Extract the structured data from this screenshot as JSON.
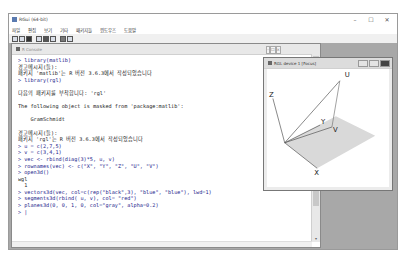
{
  "window": {
    "title": "RGui (64-bit)",
    "controls": {
      "minimize": "–",
      "maximize": "☐",
      "close": "✕"
    }
  },
  "menubar": {
    "items": [
      {
        "label": "파일"
      },
      {
        "label": "편집"
      },
      {
        "label": "보기"
      },
      {
        "label": "기타"
      },
      {
        "label": "패키지들"
      },
      {
        "label": "윈도우즈"
      },
      {
        "label": "도움말"
      }
    ]
  },
  "toolbar": {
    "buttons": [
      {
        "icon": "open-script-icon"
      },
      {
        "icon": "load-workspace-icon"
      },
      {
        "icon": "save-workspace-icon"
      },
      {
        "icon": "copy-icon"
      },
      {
        "icon": "paste-icon"
      },
      {
        "icon": "copy-paste-icon"
      },
      {
        "icon": "stop-icon"
      },
      {
        "icon": "print-icon"
      }
    ]
  },
  "console": {
    "title": "R Console",
    "lines": [
      {
        "type": "in",
        "text": "> library(matlib)"
      },
      {
        "type": "out",
        "text": "경고메시지(들):"
      },
      {
        "type": "out",
        "text": "패키지 'matlib'는 R 버전 3.6.3에서 작성되었습니다"
      },
      {
        "type": "in",
        "text": "> library(rgl)"
      },
      {
        "type": "out",
        "text": ""
      },
      {
        "type": "out",
        "text": "다음의 패키지를 부착합니다: 'rgl'"
      },
      {
        "type": "out",
        "text": ""
      },
      {
        "type": "out",
        "text": "The following object is masked from 'package:matlib':"
      },
      {
        "type": "out",
        "text": ""
      },
      {
        "type": "out",
        "text": "    GramSchmidt"
      },
      {
        "type": "out",
        "text": ""
      },
      {
        "type": "out",
        "text": "경고메시지(들):"
      },
      {
        "type": "out",
        "text": "패키지 'rgl'는 R 버전 3.6.3에서 작성되었습니다"
      },
      {
        "type": "in",
        "text": "> u = c(2,7,5)"
      },
      {
        "type": "in",
        "text": "> v = c(3,4,1)"
      },
      {
        "type": "in",
        "text": "> vec <- rbind(diag(3)*5, u, v)"
      },
      {
        "type": "in",
        "text": "> rownames(vec) <- c(\"X\", \"Y\", \"Z\", \"U\", \"V\")"
      },
      {
        "type": "in",
        "text": "> open3d()"
      },
      {
        "type": "out",
        "text": "wgl"
      },
      {
        "type": "out",
        "text": "  1"
      },
      {
        "type": "in",
        "text": "> vectors3d(vec, col=c(rep(\"black\",3), \"blue\", \"blue\"), lwd=1)"
      },
      {
        "type": "in",
        "text": "> segments3d(rbind( u, v), col= \"red\")"
      },
      {
        "type": "in",
        "text": "> planes3d(0, 0, 1, 0, col=\"gray\", alpha=0.2)"
      },
      {
        "type": "in",
        "text": "> |"
      }
    ]
  },
  "rgl_device": {
    "title": "RGL device 1 [Focus]",
    "labels": {
      "x": "X",
      "y": "Y",
      "z": "Z",
      "u": "U",
      "v": "V"
    },
    "colors": {
      "plane": "#d9d9d9",
      "axes": "#555555",
      "vectors": "#555555",
      "segment": "#777777"
    }
  }
}
